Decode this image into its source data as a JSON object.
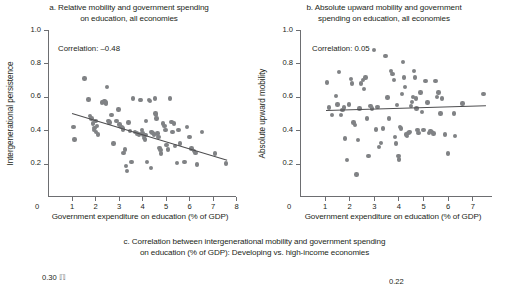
{
  "figure": {
    "background": "#ffffff",
    "dot_color": "#808285",
    "line_color": "#4d4d4f",
    "axis_color": "#6d6e71",
    "text_color": "#231f20"
  },
  "panel_a": {
    "title_line1": "a. Relative mobility and government spending",
    "title_line2": "on education, all economies",
    "correlation_note": "Correlation: –0.48",
    "ylabel": "Intergenerational persistence",
    "xlabel": "Government expenditure on education (% of GDP)",
    "yticks": [
      "1.0",
      "0.8",
      "0.6",
      "0.4",
      "0.2"
    ],
    "xticks": [
      "1",
      "2",
      "3",
      "4",
      "5",
      "6",
      "7",
      "8"
    ],
    "xzero": "0"
  },
  "panel_b": {
    "title_line1": "b. Absolute upward mobility and government",
    "title_line2": "spending on education, all economies",
    "correlation_note": "Correlation: 0.05",
    "ylabel": "Absolute upward mobility",
    "xlabel": "Government expenditure on education (% of GDP)",
    "yticks": [
      "1.0",
      "0.8",
      "0.6",
      "0.4",
      "0.2"
    ],
    "xticks": [
      "1",
      "2",
      "3",
      "4",
      "5",
      "6",
      "7"
    ],
    "xzero": "0"
  },
  "panel_c": {
    "title_line1": "c. Correlation between intergenerational mobility and government spending",
    "title_line2": "on education (% of GDP): Developing vs. high-income economies",
    "ytop_left": "0.30",
    "ytop_right": "0.22"
  },
  "chart_data": [
    {
      "id": "panel_a",
      "type": "scatter",
      "title": "a. Relative mobility and government spending on education, all economies",
      "xlabel": "Government expenditure on education (% of GDP)",
      "ylabel": "Intergenerational persistence",
      "xlim": [
        0,
        8
      ],
      "ylim": [
        0,
        1.0
      ],
      "xticks": [
        0,
        1,
        2,
        3,
        4,
        5,
        6,
        7,
        8
      ],
      "yticks": [
        0.2,
        0.4,
        0.6,
        0.8,
        1.0
      ],
      "grid": false,
      "legend": null,
      "annotations": [
        "Correlation: -0.48"
      ],
      "correlation": -0.48,
      "trendline": {
        "x": [
          1.0,
          7.6
        ],
        "y": [
          0.505,
          0.225
        ]
      },
      "points": [
        [
          1.08,
          0.42
        ],
        [
          1.12,
          0.345
        ],
        [
          1.55,
          0.71
        ],
        [
          1.72,
          0.585
        ],
        [
          1.78,
          0.485
        ],
        [
          1.85,
          0.47
        ],
        [
          1.92,
          0.44
        ],
        [
          1.95,
          0.4
        ],
        [
          1.98,
          0.415
        ],
        [
          2.02,
          0.455
        ],
        [
          2.05,
          0.39
        ],
        [
          2.08,
          0.425
        ],
        [
          2.12,
          0.375
        ],
        [
          2.3,
          0.565
        ],
        [
          2.36,
          0.57
        ],
        [
          2.4,
          0.575
        ],
        [
          2.44,
          0.565
        ],
        [
          2.48,
          0.56
        ],
        [
          2.52,
          0.66
        ],
        [
          2.58,
          0.455
        ],
        [
          2.62,
          0.445
        ],
        [
          2.7,
          0.49
        ],
        [
          2.78,
          0.32
        ],
        [
          2.92,
          0.455
        ],
        [
          3.0,
          0.525
        ],
        [
          3.05,
          0.435
        ],
        [
          3.12,
          0.42
        ],
        [
          3.18,
          0.41
        ],
        [
          3.2,
          0.4
        ],
        [
          3.22,
          0.265
        ],
        [
          3.28,
          0.285
        ],
        [
          3.32,
          0.185
        ],
        [
          3.35,
          0.155
        ],
        [
          3.42,
          0.445
        ],
        [
          3.48,
          0.395
        ],
        [
          3.55,
          0.21
        ],
        [
          3.62,
          0.59
        ],
        [
          3.7,
          0.39
        ],
        [
          3.78,
          0.38
        ],
        [
          3.86,
          0.375
        ],
        [
          3.92,
          0.58
        ],
        [
          3.96,
          0.58
        ],
        [
          4.0,
          0.4
        ],
        [
          4.02,
          0.385
        ],
        [
          4.05,
          0.37
        ],
        [
          4.08,
          0.355
        ],
        [
          4.12,
          0.345
        ],
        [
          4.15,
          0.37
        ],
        [
          4.18,
          0.455
        ],
        [
          4.22,
          0.21
        ],
        [
          4.3,
          0.58
        ],
        [
          4.35,
          0.575
        ],
        [
          4.38,
          0.175
        ],
        [
          4.4,
          0.39
        ],
        [
          4.45,
          0.385
        ],
        [
          4.5,
          0.375
        ],
        [
          4.55,
          0.59
        ],
        [
          4.58,
          0.5
        ],
        [
          4.6,
          0.49
        ],
        [
          4.62,
          0.47
        ],
        [
          4.66,
          0.38
        ],
        [
          4.7,
          0.36
        ],
        [
          4.74,
          0.295
        ],
        [
          4.78,
          0.28
        ],
        [
          4.82,
          0.26
        ],
        [
          4.9,
          0.44
        ],
        [
          4.95,
          0.425
        ],
        [
          5.0,
          0.4
        ],
        [
          5.05,
          0.31
        ],
        [
          5.1,
          0.285
        ],
        [
          5.18,
          0.59
        ],
        [
          5.25,
          0.45
        ],
        [
          5.3,
          0.39
        ],
        [
          5.35,
          0.44
        ],
        [
          5.4,
          0.305
        ],
        [
          5.48,
          0.205
        ],
        [
          5.55,
          0.4
        ],
        [
          5.62,
          0.32
        ],
        [
          5.8,
          0.21
        ],
        [
          5.92,
          0.42
        ],
        [
          6.02,
          0.36
        ],
        [
          6.1,
          0.29
        ],
        [
          6.2,
          0.275
        ],
        [
          6.28,
          0.265
        ],
        [
          6.35,
          0.195
        ],
        [
          6.55,
          0.39
        ],
        [
          7.1,
          0.26
        ],
        [
          7.58,
          0.2
        ]
      ]
    },
    {
      "id": "panel_b",
      "type": "scatter",
      "title": "b. Absolute upward mobility and government spending on education, all economies",
      "xlabel": "Government expenditure on education (% of GDP)",
      "ylabel": "Absolute upward mobility",
      "xlim": [
        0,
        7.8
      ],
      "ylim": [
        0,
        1.0
      ],
      "xticks": [
        0,
        1,
        2,
        3,
        4,
        5,
        6,
        7
      ],
      "yticks": [
        0.2,
        0.4,
        0.6,
        0.8,
        1.0
      ],
      "grid": false,
      "legend": null,
      "annotations": [
        "Correlation: 0.05"
      ],
      "correlation": 0.05,
      "trendline": {
        "x": [
          1.05,
          7.55
        ],
        "y": [
          0.52,
          0.548
        ]
      },
      "points": [
        [
          1.1,
          0.685
        ],
        [
          1.18,
          0.535
        ],
        [
          1.3,
          0.49
        ],
        [
          1.45,
          0.605
        ],
        [
          1.52,
          0.555
        ],
        [
          1.58,
          0.75
        ],
        [
          1.66,
          0.49
        ],
        [
          1.72,
          0.52
        ],
        [
          1.78,
          0.535
        ],
        [
          1.84,
          0.35
        ],
        [
          1.9,
          0.22
        ],
        [
          2.0,
          0.555
        ],
        [
          2.08,
          0.705
        ],
        [
          2.12,
          0.68
        ],
        [
          2.18,
          0.445
        ],
        [
          2.24,
          0.43
        ],
        [
          2.3,
          0.135
        ],
        [
          2.36,
          0.34
        ],
        [
          2.42,
          0.53
        ],
        [
          2.48,
          0.68
        ],
        [
          2.55,
          0.7
        ],
        [
          2.6,
          0.645
        ],
        [
          2.66,
          0.715
        ],
        [
          2.72,
          0.47
        ],
        [
          2.78,
          0.245
        ],
        [
          2.86,
          0.545
        ],
        [
          2.92,
          0.53
        ],
        [
          3.0,
          0.88
        ],
        [
          3.08,
          0.405
        ],
        [
          3.15,
          0.54
        ],
        [
          3.22,
          0.3
        ],
        [
          3.3,
          0.325
        ],
        [
          3.38,
          0.41
        ],
        [
          3.48,
          0.845
        ],
        [
          3.55,
          0.595
        ],
        [
          3.62,
          0.47
        ],
        [
          3.7,
          0.755
        ],
        [
          3.76,
          0.735
        ],
        [
          3.82,
          0.7
        ],
        [
          3.86,
          0.36
        ],
        [
          3.9,
          0.32
        ],
        [
          3.95,
          0.55
        ],
        [
          4.0,
          0.245
        ],
        [
          4.02,
          0.225
        ],
        [
          4.05,
          0.42
        ],
        [
          4.1,
          0.41
        ],
        [
          4.14,
          0.615
        ],
        [
          4.18,
          0.81
        ],
        [
          4.22,
          0.715
        ],
        [
          4.26,
          0.66
        ],
        [
          4.3,
          0.375
        ],
        [
          4.35,
          0.365
        ],
        [
          4.4,
          0.385
        ],
        [
          4.45,
          0.39
        ],
        [
          4.5,
          0.545
        ],
        [
          4.54,
          0.57
        ],
        [
          4.58,
          0.6
        ],
        [
          4.62,
          0.755
        ],
        [
          4.66,
          0.715
        ],
        [
          4.7,
          0.59
        ],
        [
          4.74,
          0.53
        ],
        [
          4.78,
          0.4
        ],
        [
          4.82,
          0.385
        ],
        [
          4.9,
          0.625
        ],
        [
          4.96,
          0.51
        ],
        [
          5.02,
          0.4
        ],
        [
          5.1,
          0.695
        ],
        [
          5.18,
          0.565
        ],
        [
          5.24,
          0.385
        ],
        [
          5.3,
          0.395
        ],
        [
          5.36,
          0.39
        ],
        [
          5.42,
          0.38
        ],
        [
          5.5,
          0.695
        ],
        [
          5.56,
          0.6
        ],
        [
          5.62,
          0.625
        ],
        [
          5.7,
          0.5
        ],
        [
          5.78,
          0.59
        ],
        [
          5.88,
          0.375
        ],
        [
          6.02,
          0.26
        ],
        [
          6.25,
          0.5
        ],
        [
          6.3,
          0.365
        ],
        [
          6.6,
          0.56
        ],
        [
          7.45,
          0.615
        ]
      ]
    }
  ]
}
